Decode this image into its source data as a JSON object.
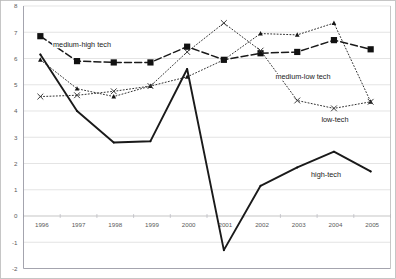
{
  "chart_data": {
    "type": "line",
    "title": "",
    "subtitle": "",
    "xlabel": "",
    "ylabel": "",
    "categories": [
      "1996",
      "1997",
      "1998",
      "1999",
      "2000",
      "2001",
      "2002",
      "2003",
      "2004",
      "2005"
    ],
    "x_tick_labels": [
      "1996",
      "1997",
      "1998",
      "1999",
      "2000",
      "2001",
      "2002",
      "2003",
      "2004",
      "2005"
    ],
    "y_tick_labels": [
      "8",
      "7",
      "6",
      "5",
      "4",
      "3",
      "2",
      "1",
      "0",
      "-1",
      "-2"
    ],
    "y_ticks": [
      8,
      7,
      6,
      5,
      4,
      3,
      2,
      1,
      0,
      -1,
      -2
    ],
    "ylim": [
      -2,
      8
    ],
    "grid": "horizontal",
    "legend_position": "inline-annotations",
    "series": [
      {
        "name": "medium-high tech",
        "marker": "filled-square",
        "line_style": "dashed",
        "values": [
          6.85,
          5.9,
          5.85,
          5.85,
          6.45,
          5.95,
          6.2,
          6.25,
          6.7,
          6.35
        ]
      },
      {
        "name": "medium-low tech",
        "marker": "small-triangle",
        "line_style": "dotted",
        "values": [
          5.95,
          4.85,
          4.55,
          4.95,
          5.3,
          5.95,
          6.95,
          6.9,
          7.35,
          4.35
        ]
      },
      {
        "name": "low-tech",
        "marker": "x-cross",
        "line_style": "dotted",
        "values": [
          4.55,
          4.6,
          4.75,
          4.95,
          6.25,
          7.35,
          6.3,
          4.4,
          4.1,
          4.35
        ]
      },
      {
        "name": "high-tech",
        "marker": "none",
        "line_style": "solid",
        "values": [
          6.15,
          4.0,
          2.8,
          2.85,
          5.6,
          -1.3,
          1.15,
          1.85,
          2.45,
          1.7
        ]
      }
    ],
    "annotations": [
      {
        "text": "medium-high tech",
        "x_px": 82,
        "y_px": 47
      },
      {
        "text": "medium-low tech",
        "x_px": 303,
        "y_px": 79
      },
      {
        "text": "low-tech",
        "x_px": 335,
        "y_px": 122
      },
      {
        "text": "high-tech",
        "x_px": 326,
        "y_px": 177
      }
    ]
  },
  "colors": {
    "series_line": "#1a1a1a",
    "gridline": "#d9d9d9",
    "axis": "#9a9aa5",
    "tick_text": "#5a5a5a",
    "background": "#ffffff",
    "plot_border": "#8f8f99"
  }
}
